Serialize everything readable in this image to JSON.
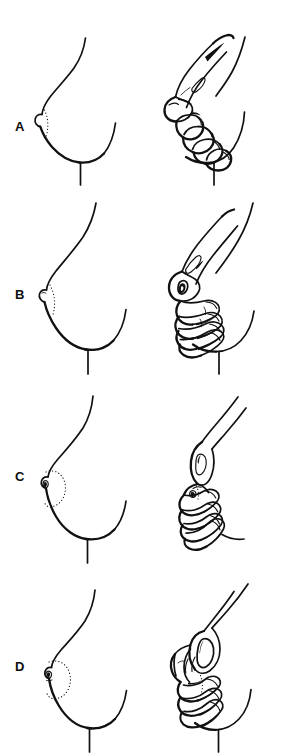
{
  "figure": {
    "background_color": "#ffffff",
    "ink_color": "#111111",
    "width": 304,
    "height": 756,
    "panel_count": 4
  },
  "panels": [
    {
      "id": "panel-a",
      "label": "A",
      "label_x": 16,
      "label_y": 120,
      "row_top": 0,
      "left_view": "breast-profile",
      "right_view": "hand-grasping-breast",
      "nipple": "protruding",
      "areola_marking": "dotted-arc"
    },
    {
      "id": "panel-b",
      "label": "B",
      "label_x": 16,
      "label_y": 288,
      "row_top": 189,
      "left_view": "breast-profile",
      "right_view": "hand-grasping-breast",
      "nipple": "protruding",
      "areola_marking": "dotted-arc"
    },
    {
      "id": "panel-c",
      "label": "C",
      "label_x": 16,
      "label_y": 475,
      "row_top": 378,
      "left_view": "breast-profile",
      "right_view": "hand-grasping-breast",
      "nipple": "small-protruding",
      "areola_marking": "dotted-circle"
    },
    {
      "id": "panel-d",
      "label": "D",
      "label_x": 16,
      "label_y": 660,
      "row_top": 567,
      "left_view": "breast-profile",
      "right_view": "hand-grasping-breast",
      "nipple": "flat",
      "areola_marking": "dotted-circle"
    }
  ]
}
